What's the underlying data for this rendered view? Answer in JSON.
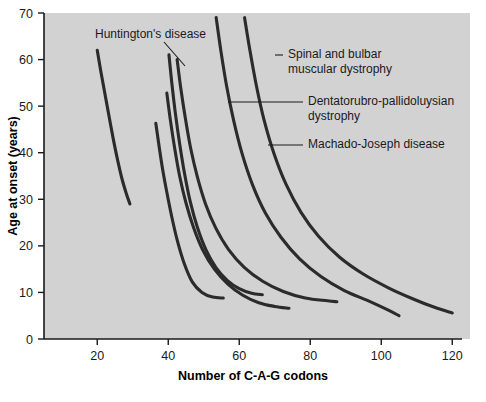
{
  "chart_data": {
    "type": "line",
    "title": "",
    "subtitle": "",
    "xlabel": "Number of C-A-G codons",
    "ylabel": "Age at onset (years)",
    "xlim": [
      5,
      125
    ],
    "ylim": [
      0,
      70
    ],
    "xticks": [
      20,
      40,
      60,
      80,
      100,
      120
    ],
    "xticklabels": [
      "20",
      "40",
      "60",
      "80",
      "100",
      "120"
    ],
    "yticks": [
      0,
      10,
      20,
      30,
      40,
      50,
      60,
      70
    ],
    "yticklabels": [
      "0",
      "10",
      "20",
      "30",
      "40",
      "50",
      "60",
      "70"
    ],
    "grid": false,
    "legend_position": "none",
    "panel_color": "#d2d2d2",
    "line_color": "#2b2b2b",
    "series": [
      {
        "name": "Huntington's disease",
        "points": [
          [
            20.0,
            62.0
          ],
          [
            21.0,
            57.5
          ],
          [
            22.2,
            52.5
          ],
          [
            23.4,
            47.5
          ],
          [
            24.6,
            42.6
          ],
          [
            25.8,
            38.2
          ],
          [
            27.0,
            34.3
          ],
          [
            28.2,
            31.2
          ],
          [
            29.2,
            29.0
          ]
        ]
      },
      {
        "name": "curve-2",
        "points": [
          [
            36.5,
            46.3
          ],
          [
            37.4,
            41.5
          ],
          [
            38.4,
            36.5
          ],
          [
            39.6,
            31.5
          ],
          [
            41.0,
            26.2
          ],
          [
            42.6,
            21.0
          ],
          [
            44.5,
            16.2
          ],
          [
            46.8,
            12.2
          ],
          [
            49.5,
            10.0
          ],
          [
            52.5,
            9.0
          ],
          [
            55.5,
            8.8
          ]
        ]
      },
      {
        "name": "curve-3",
        "points": [
          [
            40.2,
            61.0
          ],
          [
            41.0,
            55.0
          ],
          [
            42.0,
            48.5
          ],
          [
            43.2,
            42.0
          ],
          [
            44.6,
            35.5
          ],
          [
            46.2,
            29.5
          ],
          [
            48.2,
            24.0
          ],
          [
            50.6,
            19.2
          ],
          [
            53.4,
            15.4
          ],
          [
            56.6,
            12.6
          ],
          [
            60.0,
            10.8
          ],
          [
            63.5,
            9.8
          ],
          [
            66.5,
            9.5
          ]
        ]
      },
      {
        "name": "curve-4",
        "points": [
          [
            39.6,
            52.8
          ],
          [
            40.6,
            47.0
          ],
          [
            41.8,
            41.0
          ],
          [
            43.2,
            35.0
          ],
          [
            45.0,
            29.2
          ],
          [
            47.2,
            23.8
          ],
          [
            49.8,
            19.0
          ],
          [
            53.0,
            15.0
          ],
          [
            56.8,
            11.8
          ],
          [
            61.0,
            9.4
          ],
          [
            65.5,
            7.8
          ],
          [
            70.0,
            7.0
          ],
          [
            74.0,
            6.6
          ]
        ]
      },
      {
        "name": "Spinal and bulbar muscular dystrophy",
        "points": [
          [
            42.5,
            60.0
          ],
          [
            43.5,
            54.0
          ],
          [
            44.8,
            47.5
          ],
          [
            46.3,
            41.0
          ],
          [
            48.2,
            34.8
          ],
          [
            50.5,
            29.0
          ],
          [
            53.4,
            23.8
          ],
          [
            57.0,
            19.2
          ],
          [
            61.4,
            15.4
          ],
          [
            66.6,
            12.4
          ],
          [
            72.4,
            10.2
          ],
          [
            78.6,
            8.8
          ],
          [
            84.8,
            8.2
          ],
          [
            87.5,
            8.0
          ]
        ]
      },
      {
        "name": "Dentatorubro-pallidoluysian dystrophy",
        "points": [
          [
            53.5,
            69.0
          ],
          [
            54.8,
            62.0
          ],
          [
            56.4,
            54.5
          ],
          [
            58.4,
            47.0
          ],
          [
            60.8,
            39.8
          ],
          [
            63.8,
            33.0
          ],
          [
            67.4,
            27.0
          ],
          [
            71.8,
            21.8
          ],
          [
            77.0,
            17.2
          ],
          [
            83.0,
            13.4
          ],
          [
            89.6,
            10.4
          ],
          [
            96.4,
            8.2
          ],
          [
            102.0,
            6.2
          ],
          [
            105.0,
            5.0
          ]
        ]
      },
      {
        "name": "Machado-Joseph disease",
        "points": [
          [
            61.5,
            69.0
          ],
          [
            63.0,
            62.0
          ],
          [
            64.8,
            54.5
          ],
          [
            67.0,
            47.0
          ],
          [
            69.8,
            39.8
          ],
          [
            73.2,
            33.2
          ],
          [
            77.4,
            27.2
          ],
          [
            82.4,
            22.0
          ],
          [
            88.2,
            17.6
          ],
          [
            94.8,
            14.0
          ],
          [
            102.0,
            11.0
          ],
          [
            109.0,
            8.6
          ],
          [
            115.0,
            6.8
          ],
          [
            120.0,
            5.6
          ]
        ]
      }
    ],
    "annotations": [
      {
        "id": "huntingtons-disease",
        "text": "Huntington's disease",
        "text_x": 95,
        "text_y": 38,
        "anchor": "start",
        "leader": [
          [
            164,
            42
          ],
          [
            185,
            66
          ]
        ]
      },
      {
        "id": "spinal-bulbar",
        "text_lines": [
          "Spinal and bulbar",
          "muscular dystrophy"
        ],
        "text_x": 288,
        "text_y": 58,
        "anchor": "start",
        "leader": [
          [
            275,
            55
          ],
          [
            283,
            55
          ]
        ]
      },
      {
        "id": "dentatorubro",
        "text_lines": [
          "Dentatorubro-pallidoluysian",
          "dystrophy"
        ],
        "text_x": 308,
        "text_y": 105,
        "anchor": "start",
        "leader": [
          [
            228,
            102
          ],
          [
            303,
            102
          ]
        ]
      },
      {
        "id": "machado-joseph",
        "text_lines": [
          "Machado-Joseph disease"
        ],
        "text_x": 308,
        "text_y": 148,
        "anchor": "start",
        "leader": [
          [
            268,
            145
          ],
          [
            303,
            145
          ]
        ]
      }
    ]
  },
  "axes": {
    "x_title": "Number of C-A-G codons",
    "y_title": "Age at onset (years)"
  }
}
